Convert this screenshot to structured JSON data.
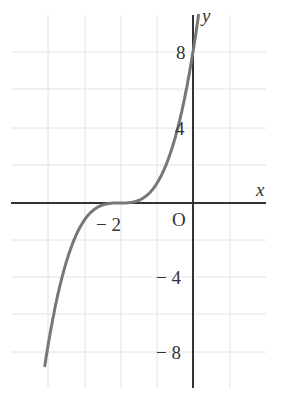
{
  "chart_data": {
    "type": "line",
    "title": "",
    "xlabel": "x",
    "ylabel": "y",
    "origin_label": "O",
    "x_ticks": [
      {
        "value": -2,
        "label": "− 2"
      }
    ],
    "y_ticks": [
      {
        "value": 8,
        "label": "8"
      },
      {
        "value": 4,
        "label": "4"
      },
      {
        "value": -4,
        "label": "− 4"
      },
      {
        "value": -8,
        "label": "− 8"
      }
    ],
    "xlim": [
      -5,
      2
    ],
    "ylim": [
      -10,
      10
    ],
    "grid": true,
    "grid_spacing": {
      "x": 1,
      "y": 2
    },
    "series": [
      {
        "name": "y = (x+2)^3",
        "color": "#777777",
        "x": [
          -4.0,
          -3.5,
          -3.0,
          -2.5,
          -2.0,
          -1.5,
          -1.0,
          -0.5,
          0.0,
          0.3
        ],
        "y": [
          -8.0,
          -3.4,
          -1.0,
          -0.1,
          0.0,
          0.1,
          1.0,
          3.4,
          8.0,
          12.2
        ]
      }
    ]
  },
  "labels": {
    "x_axis": "x",
    "y_axis": "y",
    "origin": "O",
    "y8": "8",
    "y4": "4",
    "yneg4": "− 4",
    "yneg8": "− 8",
    "xneg2": "− 2"
  }
}
